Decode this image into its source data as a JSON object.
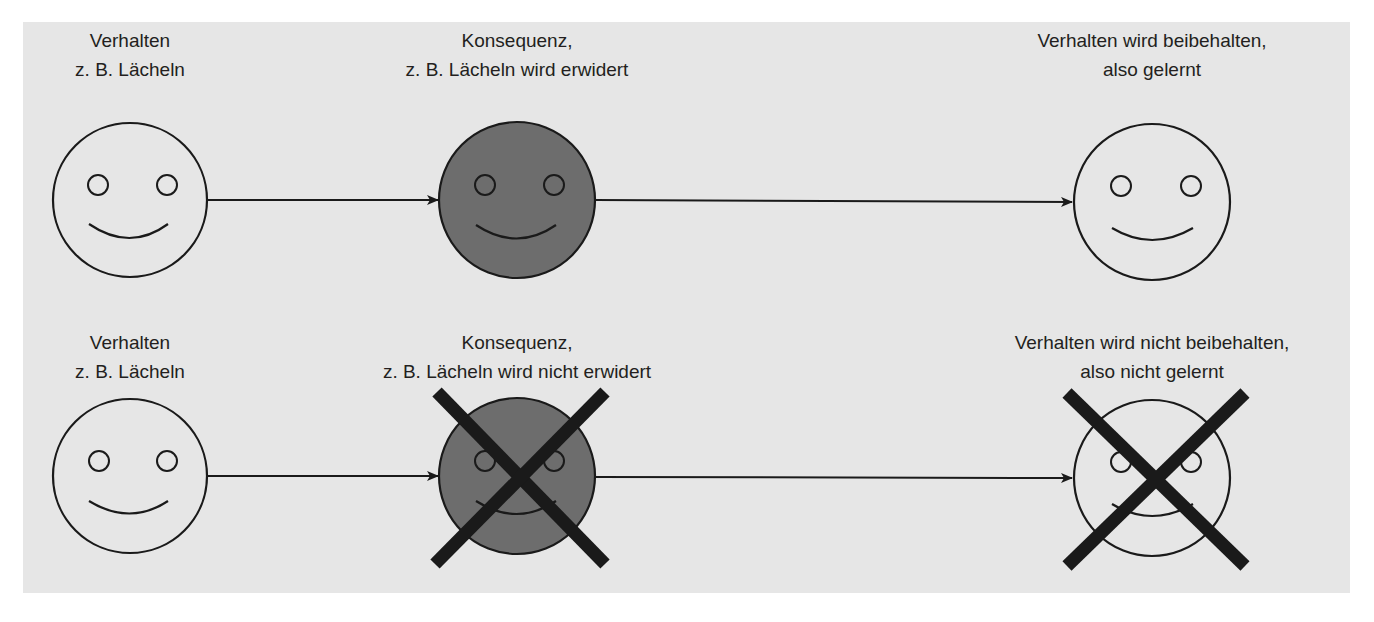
{
  "colors": {
    "background": "#e6e6e6",
    "stroke": "#1a1a1a",
    "consequence_fill": "#6d6d6d",
    "cross": "#1a1a1a"
  },
  "rows": [
    {
      "name": "reinforced",
      "behavior": {
        "line1": "Verhalten",
        "line2": "z. B. Lächeln",
        "icon": "smiley-face-outline"
      },
      "consequence": {
        "line1": "Konsequenz,",
        "line2": "z. B. Lächeln wird erwidert",
        "icon": "smiley-face-filled-gray"
      },
      "outcome": {
        "line1": "Verhalten wird beibehalten,",
        "line2": "also gelernt",
        "icon": "smiley-face-outline"
      }
    },
    {
      "name": "not-reinforced",
      "behavior": {
        "line1": "Verhalten",
        "line2": "z. B. Lächeln",
        "icon": "smiley-face-outline"
      },
      "consequence": {
        "line1": "Konsequenz,",
        "line2": "z. B. Lächeln wird nicht erwidert",
        "icon": "smiley-face-filled-gray-crossed"
      },
      "outcome": {
        "line1": "Verhalten wird nicht beibehalten,",
        "line2": "also nicht gelernt",
        "icon": "smiley-face-outline-crossed"
      }
    }
  ]
}
